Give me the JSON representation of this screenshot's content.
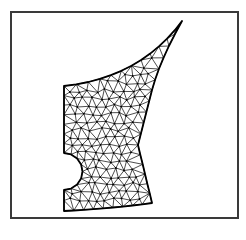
{
  "figure": {
    "frame": {
      "x": 10,
      "y": 11,
      "width": 227,
      "height": 206,
      "stroke": "#3a3a3a"
    },
    "colors": {
      "mesh_line": "#111111",
      "boundary": "#000000",
      "background": "#ffffff"
    }
  },
  "boundary": {
    "top_left": [
      64,
      86
    ],
    "notch_top": [
      64,
      153
    ],
    "notch_apex": [
      83,
      171
    ],
    "notch_bottom": [
      64,
      190
    ],
    "bottom_left": [
      64,
      211
    ],
    "bottom_right": [
      152,
      203
    ],
    "right_waist": [
      138,
      145
    ],
    "right_upper": [
      152,
      90
    ],
    "tip": [
      182,
      21
    ]
  },
  "mesh": {
    "node_spacing": 9,
    "triangles_style": "unstructured"
  }
}
